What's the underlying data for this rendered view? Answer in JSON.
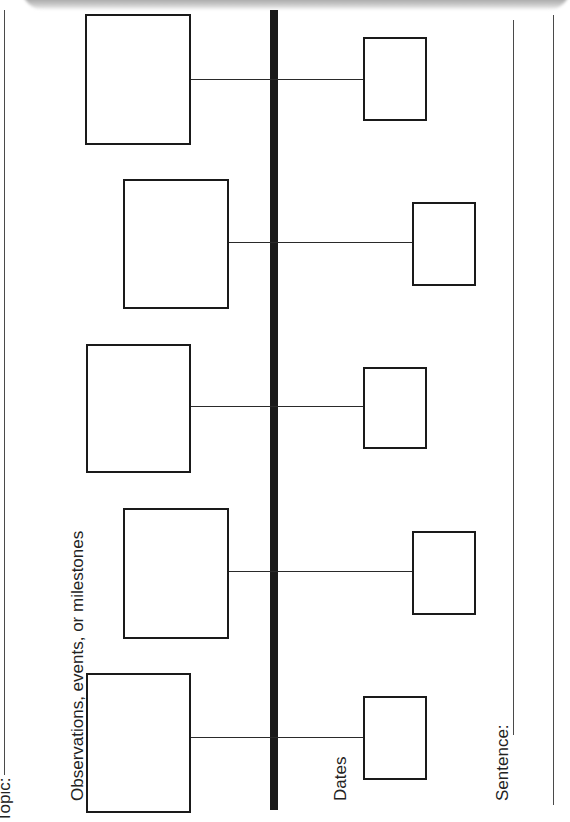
{
  "worksheet": {
    "type": "timeline graphic organizer",
    "orientation": "rotated 90deg (reads bottom-to-top)",
    "labels": {
      "topic": "Topic:",
      "observations": "Observations, events, or milestones",
      "dates": "Dates",
      "sentence": "Sentence:"
    },
    "colors": {
      "ink": "#1a1a1a",
      "background": "#ffffff",
      "shadow": "#9a9a9a"
    },
    "events": [
      {
        "index": 1,
        "event_box": "",
        "date_box": ""
      },
      {
        "index": 2,
        "event_box": "",
        "date_box": ""
      },
      {
        "index": 3,
        "event_box": "",
        "date_box": ""
      },
      {
        "index": 4,
        "event_box": "",
        "date_box": ""
      },
      {
        "index": 5,
        "event_box": "",
        "date_box": ""
      }
    ]
  }
}
